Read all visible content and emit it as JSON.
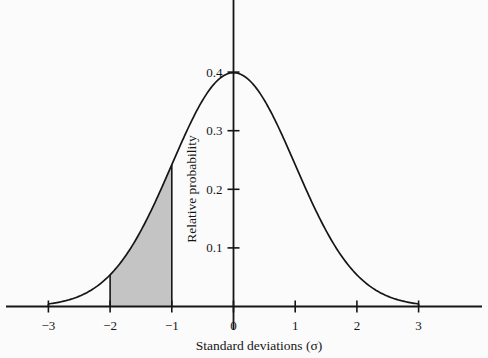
{
  "figure": {
    "background_color": "#fbfbfb",
    "ink_color": "#161616",
    "shade_color": "#c4c4c4"
  },
  "axis_titles": {
    "x": "Standard deviations (σ)",
    "y": "Relative probability"
  },
  "x_ticks": [
    "−3",
    "−2",
    "−1",
    "0",
    "1",
    "2",
    "3"
  ],
  "y_ticks": [
    "0.1",
    "0.2",
    "0.3",
    "0.4"
  ],
  "chart_data": {
    "type": "area",
    "title": "",
    "subtitle": "",
    "xlabel": "Standard deviations (σ)",
    "ylabel": "Relative probability",
    "xlim": [
      -3,
      3
    ],
    "ylim": [
      0,
      0.43
    ],
    "grid": false,
    "legend": "none",
    "x_tick_values": [
      -3,
      -2,
      -1,
      0,
      1,
      2,
      3
    ],
    "x_tick_labels": [
      "−3",
      "−2",
      "−1",
      "0",
      "1",
      "2",
      "3"
    ],
    "y_tick_values": [
      0.1,
      0.2,
      0.3,
      0.4
    ],
    "y_tick_labels": [
      "0.1",
      "0.2",
      "0.3",
      "0.4"
    ],
    "series": [
      {
        "name": "Standard normal probability density",
        "type": "line",
        "x": [
          -3,
          -2.8,
          -2.6,
          -2.4,
          -2.2,
          -2,
          -1.8,
          -1.6,
          -1.4,
          -1.2,
          -1,
          -0.8,
          -0.6,
          -0.4,
          -0.2,
          0,
          0.2,
          0.4,
          0.6,
          0.8,
          1,
          1.2,
          1.4,
          1.6,
          1.8,
          2,
          2.2,
          2.4,
          2.6,
          2.8,
          3
        ],
        "values": [
          0.0044,
          0.0079,
          0.0136,
          0.0224,
          0.0355,
          0.054,
          0.079,
          0.1109,
          0.1497,
          0.1942,
          0.242,
          0.2897,
          0.3332,
          0.3683,
          0.391,
          0.3989,
          0.391,
          0.3683,
          0.3332,
          0.2897,
          0.242,
          0.1942,
          0.1497,
          0.1109,
          0.079,
          0.054,
          0.0355,
          0.0224,
          0.0136,
          0.0079,
          0.0044
        ]
      }
    ],
    "shaded_region": {
      "name": "Area between −2σ and −1σ",
      "x_start": -2,
      "x_end": -1,
      "y_at_start": 0.054,
      "y_at_end": 0.242,
      "fill": "#c4c4c4",
      "area": 0.1359
    },
    "peak": {
      "x": 0,
      "y": 0.3989
    }
  }
}
